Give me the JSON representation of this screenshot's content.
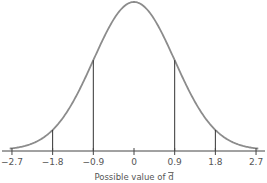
{
  "chart_data": {
    "type": "line",
    "title": "",
    "xlabel": "Possible value of d̄",
    "xlabel_text": "Possible value of ",
    "xlabel_symbol": "d",
    "ylabel": "",
    "distribution": "normal",
    "mean": 0,
    "sd": 0.9,
    "x_ticks": [
      -2.7,
      -1.8,
      -0.9,
      0,
      0.9,
      1.8,
      2.7
    ],
    "x_tick_labels": [
      "−2.7",
      "−1.8",
      "−0.9",
      "0",
      "0.9",
      "1.8",
      "2.7"
    ],
    "vertical_lines_at": [
      -1.8,
      -0.9,
      0.9,
      1.8
    ],
    "xlim": [
      -2.8,
      2.8
    ],
    "grid": false,
    "legend": null,
    "colors": {
      "curve": "#8c8c8c",
      "axis": "#444444",
      "lines": "#333333"
    }
  }
}
